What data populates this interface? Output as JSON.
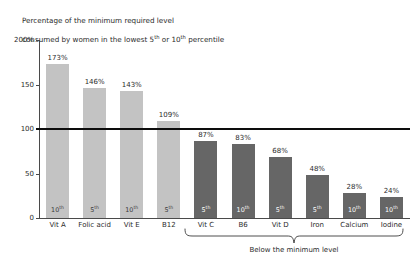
{
  "chart_data": {
    "type": "bar",
    "title": "Percentage of the minimum required level\nconsumed by women in the lowest 5th or 10th percentile",
    "title_line1": "Percentage of the minimum required level",
    "title_line2_a": "consumed by women in the lowest 5",
    "title_line2_sup1": "th",
    "title_line2_b": " or 10",
    "title_line2_sup2": "th",
    "title_line2_c": " percentile",
    "xlabel": "",
    "ylabel": "",
    "ylim": [
      0,
      200
    ],
    "yticks": [
      0,
      50,
      100,
      150,
      200
    ],
    "ytick_labels": [
      "0",
      "50",
      "100",
      "150",
      "200%"
    ],
    "grid": false,
    "legend": "none",
    "reference_line": {
      "value": 100,
      "label": "minimum required level",
      "color": "#0d0d0d"
    },
    "categories": [
      "Vit A",
      "Folic acid",
      "Vit E",
      "B12",
      "Vit C",
      "B6",
      "Vit D",
      "Iron",
      "Calcium",
      "Iodine"
    ],
    "values": [
      173,
      146,
      143,
      109,
      87,
      83,
      68,
      48,
      28,
      24
    ],
    "value_labels": [
      "173%",
      "146%",
      "143%",
      "109%",
      "87%",
      "83%",
      "68%",
      "48%",
      "28%",
      "24%"
    ],
    "percentiles": [
      "10",
      "5",
      "10",
      "5",
      "5",
      "10",
      "5",
      "5",
      "10",
      "10"
    ],
    "percentile_suffix": "th",
    "above_minimum": [
      true,
      true,
      true,
      true,
      false,
      false,
      false,
      false,
      false,
      false
    ],
    "annotation": {
      "text": "Below the minimum level",
      "spans_categories": [
        "Vit C",
        "B6",
        "Vit D",
        "Iron",
        "Calcium",
        "Iodine"
      ]
    },
    "colors": {
      "bar_above": "#c3c3c3",
      "bar_below": "#666666",
      "reference_line": "#0d0d0d",
      "axis": "#4a4a4a",
      "text": "#2b2b2b",
      "background": "#ffffff"
    }
  }
}
